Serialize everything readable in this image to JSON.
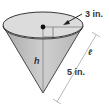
{
  "diagram": {
    "shape": "cone",
    "labels": {
      "radius": "3 in.",
      "slant_height": "5 in.",
      "height": "h",
      "slant_symbol": "ℓ"
    },
    "colors": {
      "cone_fill": "#bdbdbd",
      "top_fill": "#d9d9d9",
      "stroke": "#222222",
      "dimension_line": "#777777"
    }
  }
}
